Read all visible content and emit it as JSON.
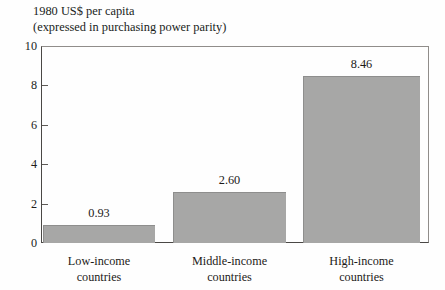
{
  "chart_data": {
    "type": "bar",
    "title": "1980 US$ per capita (expressed in purchasing power parity)",
    "title_lines": [
      "1980 US$ per capita",
      "(expressed in purchasing power parity)"
    ],
    "categories": [
      "Low-income countries",
      "Middle-income countries",
      "High-income countries"
    ],
    "category_lines": [
      [
        "Low-income",
        "countries"
      ],
      [
        "Middle-income",
        "countries"
      ],
      [
        "High-income",
        "countries"
      ]
    ],
    "values": [
      0.93,
      2.6,
      8.46
    ],
    "value_labels": [
      "0.93",
      "2.60",
      "8.46"
    ],
    "xlabel": "",
    "ylabel": "",
    "ylim": [
      0,
      10
    ],
    "yticks": [
      0,
      2,
      4,
      6,
      8,
      10
    ],
    "ytick_labels": [
      "0",
      "2",
      "4",
      "6",
      "8",
      "10"
    ],
    "grid": false,
    "legend": false,
    "bar_color": "#a7a7a6",
    "bar_edge_color": "#8e8e8d",
    "axis_color": "#4a4845",
    "background": "#fefefe"
  }
}
